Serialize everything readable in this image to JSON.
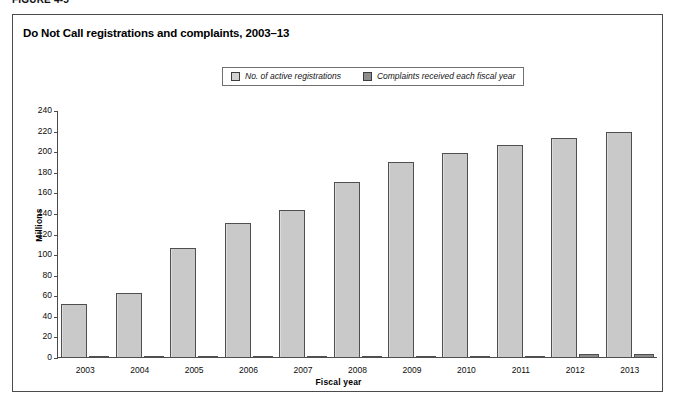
{
  "figure": {
    "number_label": "FIGURE 4-5",
    "title": "Do Not Call registrations and complaints, 2003–13"
  },
  "legend": {
    "position": "top-center",
    "entries": [
      {
        "label": "No. of active registrations",
        "swatch": "light-gray-square",
        "color": "#d2d2d2"
      },
      {
        "label": "Complaints received each fiscal year",
        "swatch": "dark-gray-square",
        "color": "#8d8d8d"
      }
    ]
  },
  "chart_data": {
    "type": "bar",
    "title": "Do Not Call registrations and complaints, 2003–13",
    "xlabel": "Fiscal year",
    "ylabel": "Millions",
    "categories": [
      "2003",
      "2004",
      "2005",
      "2006",
      "2007",
      "2008",
      "2009",
      "2010",
      "2011",
      "2012",
      "2013"
    ],
    "series": [
      {
        "name": "No. of active registrations",
        "color": "#c9c9c9",
        "values": [
          52,
          63,
          107,
          131,
          144,
          171,
          190,
          199,
          207,
          214,
          220
        ]
      },
      {
        "name": "Complaints received each fiscal year",
        "color": "#8a8a8a",
        "values": [
          0.3,
          0.6,
          0.8,
          1.0,
          1.1,
          1.8,
          1.6,
          1.6,
          2.0,
          3.8,
          3.7
        ]
      }
    ],
    "ylim": [
      0,
      240
    ],
    "ytick_step": 20,
    "yticks": [
      0,
      20,
      40,
      60,
      80,
      100,
      120,
      140,
      160,
      180,
      200,
      220,
      240
    ],
    "grid": false,
    "legend_position": "top-center"
  }
}
